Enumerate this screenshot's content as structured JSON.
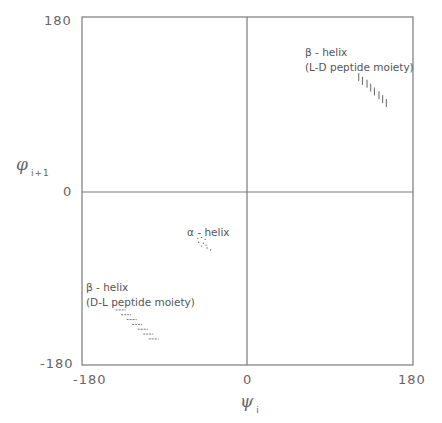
{
  "chart_data": {
    "type": "scatter",
    "title": "",
    "xlabel": "ψ_i",
    "ylabel": "φ_(i+1)",
    "xlim": [
      -180,
      180
    ],
    "ylim": [
      -180,
      180
    ],
    "x_ticks": [
      "-180",
      "0",
      "180"
    ],
    "y_ticks": [
      "180",
      "0",
      "-180"
    ],
    "grid": false,
    "quadrant_lines": {
      "x": 0,
      "y": 0
    },
    "series": [
      {
        "name": "β-helix (L-D peptide moiety)",
        "marker": "vertical-tick",
        "points": [
          [
            121,
            118
          ],
          [
            125,
            114
          ],
          [
            130,
            111
          ],
          [
            134,
            107
          ],
          [
            138,
            103
          ],
          [
            143,
            99
          ],
          [
            147,
            95
          ],
          [
            151,
            91
          ]
        ]
      },
      {
        "name": "α-helix",
        "marker": "dot",
        "points": [
          [
            -54,
            -49
          ],
          [
            -50,
            -48
          ],
          [
            -46,
            -50
          ],
          [
            -53,
            -53
          ],
          [
            -48,
            -54
          ],
          [
            -45,
            -56
          ],
          [
            -50,
            -57
          ],
          [
            -44,
            -59
          ],
          [
            -40,
            -61
          ]
        ]
      },
      {
        "name": "β-helix (D-L peptide moiety)",
        "marker": "horizontal-dash",
        "points": [
          [
            -138,
            -123
          ],
          [
            -132,
            -128
          ],
          [
            -126,
            -133
          ],
          [
            -120,
            -138
          ],
          [
            -114,
            -143
          ],
          [
            -108,
            -148
          ],
          [
            -102,
            -153
          ]
        ]
      }
    ]
  },
  "axes": {
    "x_label_symbol": "ψ",
    "x_label_sub": "i",
    "y_label_symbol": "φ",
    "y_label_sub": "i+1",
    "x_tick_left": "-180",
    "x_tick_mid": "0",
    "x_tick_right": "180",
    "y_tick_top": "180",
    "y_tick_mid": "0",
    "y_tick_bottom": "-180"
  },
  "annotations": {
    "beta_ld_title": "β - helix",
    "beta_ld_sub": "(L-D peptide  moiety)",
    "alpha_title": "α - helix",
    "beta_dl_title": "β - helix",
    "beta_dl_sub": "(D-L peptide  moiety)"
  },
  "colors": {
    "frame": "#777777",
    "marker": "#666666",
    "text": "#555555"
  }
}
